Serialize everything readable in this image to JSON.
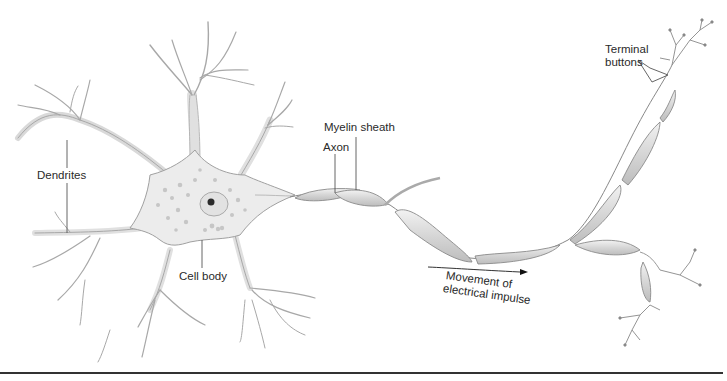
{
  "diagram": {
    "labels": {
      "dendrites": "Dendrites",
      "cell_body": "Cell body",
      "axon": "Axon",
      "myelin_sheath": "Myelin sheath",
      "terminal_buttons_line1": "Terminal",
      "terminal_buttons_line2": "buttons",
      "impulse_line1": "Movement of",
      "impulse_line2": "electrical impulse"
    },
    "colors": {
      "background": "#ffffff",
      "cell_fill": "#ededed",
      "cell_stroke": "#9a9a9a",
      "granule": "#c4c4c4",
      "nucleus": "#2b2b2b",
      "myelin_fill": "#dcdcdc",
      "leader_line": "#555555",
      "rule": "#333333"
    }
  }
}
